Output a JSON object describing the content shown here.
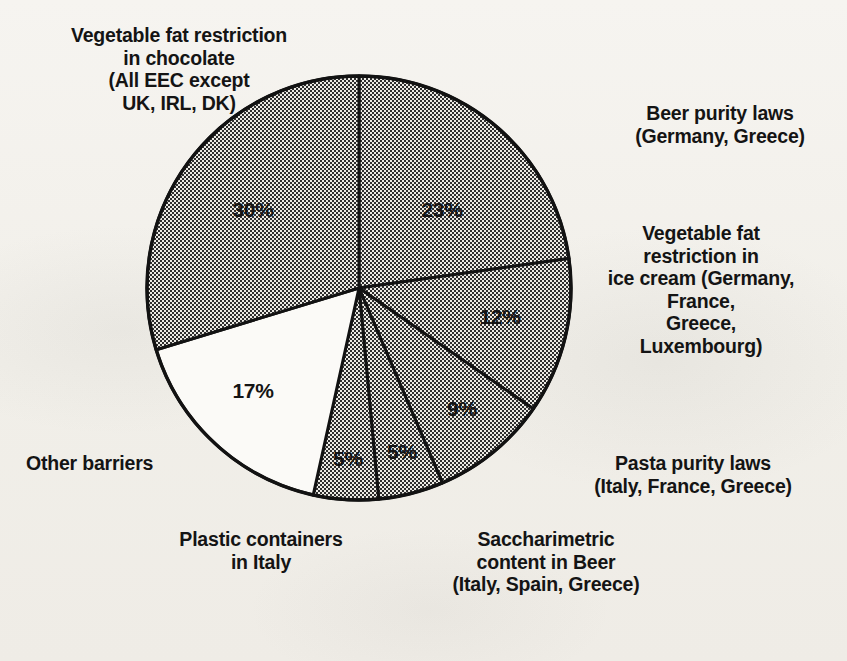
{
  "chart_data": {
    "type": "pie",
    "title": "",
    "subtitle": "",
    "xlabel": "",
    "ylabel": "",
    "legend_position": "callout-labels-around-pie",
    "grid": false,
    "units": "percent",
    "total": 101,
    "start_angle_deg": 0,
    "direction": "clockwise",
    "categories": [
      "Beer purity laws (Germany, Greece)",
      "Vegetable fat restriction in ice cream (Germany, France, Greece, Luxembourg)",
      "Pasta purity laws (Italy, France, Greece)",
      "Saccharimetric content in Beer (Italy, Spain, Greece)",
      "Plastic containers in Italy",
      "Other barriers",
      "Vegetable fat restriction in chocolate (All EEC except UK, IRL, DK)"
    ],
    "values": [
      23,
      12,
      9,
      5,
      5,
      17,
      30
    ],
    "value_labels": [
      "23%",
      "12%",
      "9%",
      "5%",
      "5%",
      "17%",
      "30%"
    ],
    "slices": [
      {
        "key": "beer-purity",
        "label": "Beer purity laws\n(Germany, Greece)",
        "value": 23,
        "value_label": "23%",
        "fill": "stipple"
      },
      {
        "key": "veg-icecream",
        "label": "Vegetable fat\nrestriction in\nice cream (Germany,\nFrance,\nGreece,\nLuxembourg)",
        "value": 12,
        "value_label": "12%",
        "fill": "stipple"
      },
      {
        "key": "pasta-purity",
        "label": "Pasta purity laws\n(Italy, France, Greece)",
        "value": 9,
        "value_label": "9%",
        "fill": "stipple"
      },
      {
        "key": "saccharimetric",
        "label": "Saccharimetric\ncontent in Beer\n(Italy, Spain, Greece)",
        "value": 5,
        "value_label": "5%",
        "fill": "stipple"
      },
      {
        "key": "plastic",
        "label": "Plastic containers\nin Italy",
        "value": 5,
        "value_label": "5%",
        "fill": "stipple"
      },
      {
        "key": "other",
        "label": "Other barriers",
        "value": 17,
        "value_label": "17%",
        "fill": "none"
      },
      {
        "key": "veg-chocolate",
        "label": "Vegetable fat restriction\nin chocolate\n(All EEC except\nUK, IRL, DK)",
        "value": 30,
        "value_label": "30%",
        "fill": "stipple"
      }
    ],
    "colors": {
      "stipple_ink": "#2a2a2a",
      "stipple_base": "#e9e7e1",
      "unfilled": "#fbfaf7",
      "outline": "#121212",
      "background": "#f3f1ec",
      "text": "#141414"
    }
  },
  "labels": {
    "veg_chocolate": "Vegetable fat restriction\nin chocolate\n(All EEC except\nUK, IRL, DK)",
    "beer_purity": "Beer purity laws\n(Germany, Greece)",
    "veg_icecream": "Vegetable fat\nrestriction in\nice cream (Germany,\nFrance,\nGreece,\nLuxembourg)",
    "pasta_purity": "Pasta purity laws\n(Italy, France, Greece)",
    "saccharimetric": "Saccharimetric\ncontent in Beer\n(Italy, Spain, Greece)",
    "plastic_containers": "Plastic containers\nin Italy",
    "other_barriers": "Other barriers"
  },
  "percent_labels": {
    "veg_chocolate": "30%",
    "beer_purity": "23%",
    "veg_icecream": "12%",
    "pasta_purity": "9%",
    "saccharimetric": "5%",
    "plastic_containers": "5%",
    "other_barriers": "17%"
  }
}
